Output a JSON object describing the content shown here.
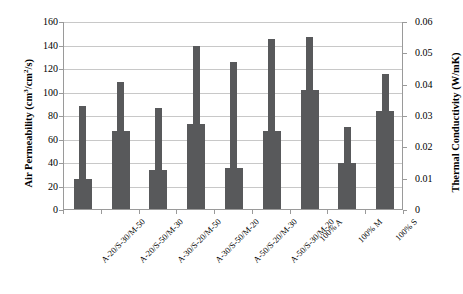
{
  "chart_data": {
    "type": "bar",
    "title": "",
    "categories": [
      "A-20/S-30/M-50",
      "A-20/S-50/M-30",
      "A-30/S-20/M-50",
      "A-30/S-50/M-20",
      "A-50/S-20/M-30",
      "A-50/S-30/M-20",
      "100% A",
      "100% M",
      "100% S"
    ],
    "series": [
      {
        "name": "Thermal Conductivity (W/mK)",
        "axis": "right",
        "values": [
          0.0096,
          0.0248,
          0.0124,
          0.0272,
          0.0132,
          0.0248,
          0.038,
          0.0148,
          0.0312
        ]
      },
      {
        "name": "Air Permeability (cm3/cm2/s)",
        "axis": "left",
        "values": [
          88,
          108,
          86,
          139,
          125,
          145,
          146,
          70,
          115
        ]
      }
    ],
    "xlabel": "",
    "ylabel_left": "Air Permeability (cm3/cm2/s)",
    "ylabel_right": "Thermal Conductivity (W/mK)",
    "ylim_left": [
      0,
      160
    ],
    "ylim_right": [
      0,
      0.06
    ],
    "yticks_left": [
      "0",
      "20",
      "40",
      "60",
      "80",
      "100",
      "120",
      "140",
      "160"
    ],
    "yticks_right": [
      "0",
      "0.01",
      "0.02",
      "0.03",
      "0.04",
      "0.05",
      "0.06"
    ],
    "grid": true,
    "legend": "none",
    "bar_color": "#58595b",
    "grid_color": "#c8c8c8",
    "axis_color": "#9a9a9a"
  },
  "axis_titles": {
    "left_pre": "Air Permeability (cm",
    "left_sup1": "3",
    "left_mid": "/cm",
    "left_sup2": "2",
    "left_post": "/s)",
    "right": "Thermal Conductivity (W/mK)"
  }
}
